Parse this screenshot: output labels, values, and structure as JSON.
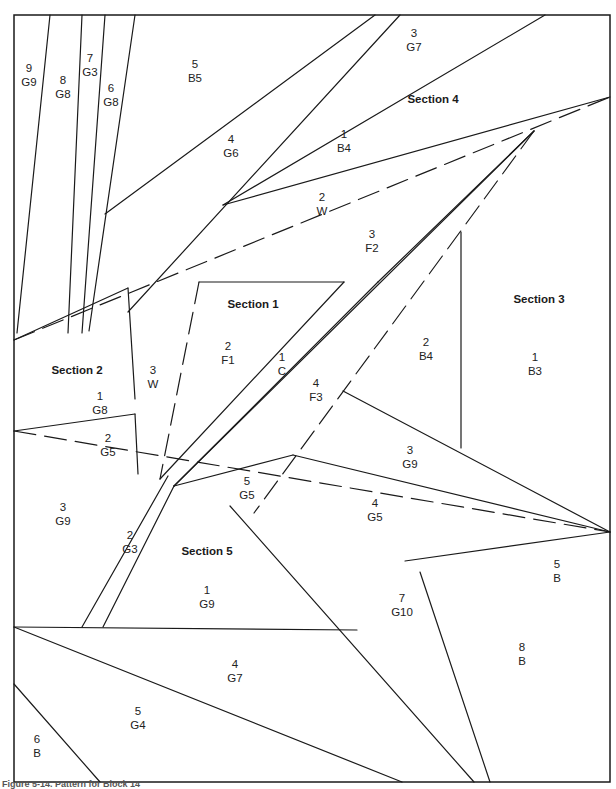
{
  "figure": {
    "caption": "Figure 5-14. Pattern for Block 14",
    "frame": {
      "x": 14,
      "y": 15,
      "width": 596,
      "height": 767
    },
    "stroke_color": "#1a1a1a"
  },
  "sections": [
    {
      "id": "section-1",
      "label": "Section 1",
      "x": 253,
      "y": 308
    },
    {
      "id": "section-2",
      "label": "Section 2",
      "x": 77,
      "y": 374
    },
    {
      "id": "section-3",
      "label": "Section 3",
      "x": 539,
      "y": 303
    },
    {
      "id": "section-4",
      "label": "Section 4",
      "x": 433,
      "y": 103
    },
    {
      "id": "section-5",
      "label": "Section 5",
      "x": 207,
      "y": 555
    }
  ],
  "pieces": [
    {
      "section": "top-fan",
      "number": "9",
      "fabric": "G9",
      "x": 29,
      "y": 72
    },
    {
      "section": "top-fan",
      "number": "8",
      "fabric": "G8",
      "x": 63,
      "y": 84
    },
    {
      "section": "top-fan",
      "number": "7",
      "fabric": "G3",
      "x": 90,
      "y": 62
    },
    {
      "section": "top-fan",
      "number": "6",
      "fabric": "G8",
      "x": 111,
      "y": 92
    },
    {
      "section": "top-fan",
      "number": "5",
      "fabric": "B5",
      "x": 195,
      "y": 68
    },
    {
      "section": "top-fan",
      "number": "4",
      "fabric": "G6",
      "x": 231,
      "y": 143
    },
    {
      "section": "section-4",
      "number": "3",
      "fabric": "G7",
      "x": 414,
      "y": 37
    },
    {
      "section": "section-4",
      "number": "1",
      "fabric": "B4",
      "x": 344,
      "y": 138
    },
    {
      "section": "section-4",
      "number": "2",
      "fabric": "W",
      "x": 322,
      "y": 201
    },
    {
      "section": "section-4",
      "number": "3",
      "fabric": "F2",
      "x": 372,
      "y": 238
    },
    {
      "section": "section-1",
      "number": "2",
      "fabric": "F1",
      "x": 228,
      "y": 350
    },
    {
      "section": "section-1",
      "number": "1",
      "fabric": "C",
      "x": 282,
      "y": 361
    },
    {
      "section": "section-1",
      "number": "4",
      "fabric": "F3",
      "x": 316,
      "y": 387
    },
    {
      "section": "section-2",
      "number": "3",
      "fabric": "W",
      "x": 153,
      "y": 374
    },
    {
      "section": "section-2",
      "number": "1",
      "fabric": "G8",
      "x": 100,
      "y": 400
    },
    {
      "section": "section-2",
      "number": "2",
      "fabric": "G5",
      "x": 108,
      "y": 442
    },
    {
      "section": "section-2",
      "number": "3",
      "fabric": "G9",
      "x": 63,
      "y": 511
    },
    {
      "section": "section-3",
      "number": "2",
      "fabric": "B4",
      "x": 426,
      "y": 346
    },
    {
      "section": "section-3",
      "number": "1",
      "fabric": "B3",
      "x": 535,
      "y": 361
    },
    {
      "section": "section-3",
      "number": "3",
      "fabric": "G9",
      "x": 410,
      "y": 454
    },
    {
      "section": "section-3",
      "number": "4",
      "fabric": "G5",
      "x": 375,
      "y": 507
    },
    {
      "section": "section-5",
      "number": "5",
      "fabric": "G5",
      "x": 247,
      "y": 485
    },
    {
      "section": "section-5",
      "number": "2",
      "fabric": "G3",
      "x": 130,
      "y": 539
    },
    {
      "section": "section-5",
      "number": "1",
      "fabric": "G9",
      "x": 207,
      "y": 594
    },
    {
      "section": "section-5",
      "number": "7",
      "fabric": "G10",
      "x": 402,
      "y": 602
    },
    {
      "section": "section-5",
      "number": "5",
      "fabric": "B",
      "x": 557,
      "y": 568
    },
    {
      "section": "section-5",
      "number": "8",
      "fabric": "B",
      "x": 522,
      "y": 651
    },
    {
      "section": "bottom",
      "number": "4",
      "fabric": "G7",
      "x": 235,
      "y": 668
    },
    {
      "section": "bottom",
      "number": "5",
      "fabric": "G4",
      "x": 138,
      "y": 715
    },
    {
      "section": "bottom",
      "number": "6",
      "fabric": "B",
      "x": 37,
      "y": 743
    }
  ],
  "solid_lines": [
    [
      50,
      15,
      17,
      333
    ],
    [
      82,
      15,
      68,
      333
    ],
    [
      105,
      15,
      82,
      333
    ],
    [
      135,
      15,
      89,
      331
    ],
    [
      375,
      15,
      105,
      214
    ],
    [
      400,
      15,
      128,
      312
    ],
    [
      545,
      15,
      223,
      205
    ],
    [
      610,
      97,
      223,
      205
    ],
    [
      14,
      340,
      128,
      288
    ],
    [
      128,
      288,
      135,
      399
    ],
    [
      14,
      431,
      135,
      414
    ],
    [
      135,
      414,
      138,
      474
    ],
    [
      199,
      282,
      344,
      282
    ],
    [
      344,
      282,
      160,
      479
    ],
    [
      378,
      282,
      174,
      486
    ],
    [
      378,
      282,
      534,
      131
    ],
    [
      534,
      131,
      174,
      486
    ],
    [
      461,
      232,
      461,
      448
    ],
    [
      343,
      391,
      610,
      532
    ],
    [
      610,
      532,
      293,
      455
    ],
    [
      293,
      455,
      174,
      486
    ],
    [
      610,
      532,
      405,
      561
    ],
    [
      168,
      476,
      82,
      627
    ],
    [
      174,
      486,
      103,
      627
    ],
    [
      14,
      627,
      357,
      630
    ],
    [
      230,
      506,
      474,
      782
    ],
    [
      420,
      572,
      490,
      782
    ],
    [
      14,
      627,
      402,
      782
    ],
    [
      14,
      684,
      100,
      782
    ]
  ],
  "dashed_lines": [
    [
      14,
      340,
      610,
      97
    ],
    [
      14,
      431,
      610,
      532
    ],
    [
      199,
      282,
      160,
      479
    ],
    [
      534,
      131,
      254,
      513
    ]
  ]
}
